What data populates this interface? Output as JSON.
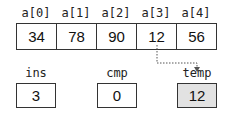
{
  "array": {
    "labels": [
      "a[0]",
      "a[1]",
      "a[2]",
      "a[3]",
      "a[4]"
    ],
    "values": [
      "34",
      "78",
      "90",
      "12",
      "56"
    ]
  },
  "variables": {
    "ins": {
      "label": "ins",
      "value": "3"
    },
    "cmp": {
      "label": "cmp",
      "value": "0"
    },
    "temp": {
      "label": "temp",
      "value": "12",
      "highlight": "#e2e2e2"
    }
  },
  "connector": {
    "from": "a[3]",
    "to": "temp",
    "style": "dotted-arrow"
  }
}
